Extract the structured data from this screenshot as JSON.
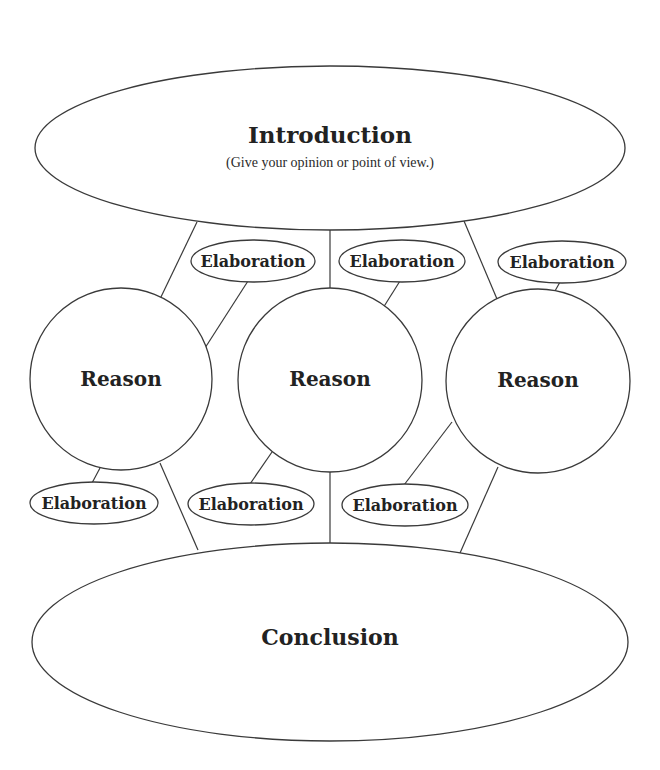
{
  "diagram": {
    "type": "essay-organizer",
    "colors": {
      "stroke": "#3a3a3a",
      "text": "#222222",
      "background": "#ffffff"
    },
    "introduction": {
      "title": "Introduction",
      "subtitle": "(Give your opinion or point of view.)"
    },
    "reasons": [
      {
        "label": "Reason"
      },
      {
        "label": "Reason"
      },
      {
        "label": "Reason"
      }
    ],
    "elaborations_top": [
      {
        "label": "Elaboration"
      },
      {
        "label": "Elaboration"
      },
      {
        "label": "Elaboration"
      }
    ],
    "elaborations_bottom": [
      {
        "label": "Elaboration"
      },
      {
        "label": "Elaboration"
      },
      {
        "label": "Elaboration"
      }
    ],
    "conclusion": {
      "title": "Conclusion"
    }
  }
}
